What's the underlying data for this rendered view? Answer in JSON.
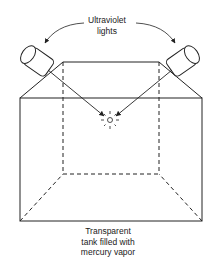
{
  "diagram": {
    "labels": {
      "lights_line1": "Ultraviolet",
      "lights_line2": "lights",
      "tank_line1": "Transparent",
      "tank_line2": "tank filled with",
      "tank_line3": "mercury vapor"
    },
    "colors": {
      "stroke": "#222222",
      "background": "#ffffff"
    }
  }
}
